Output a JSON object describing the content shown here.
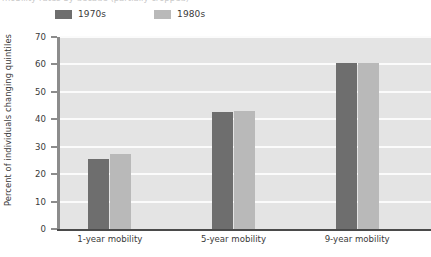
{
  "caption": {
    "cut_off_text": "mobility rates by decade (partially cropped)"
  },
  "legend": {
    "position": "top-left",
    "items": [
      {
        "label": "1970s",
        "color": "#6e6e6e",
        "swatch_name": "legend-swatch-1970s"
      },
      {
        "label": "1980s",
        "color": "#b9b9b9",
        "swatch_name": "legend-swatch-1980s"
      }
    ]
  },
  "axes": {
    "ylabel": "Percent of individuals changing quintiles",
    "xlabel": "",
    "yticks": [
      0,
      10,
      20,
      30,
      40,
      50,
      60,
      70
    ],
    "ylim": [
      0,
      70
    ]
  },
  "colors": {
    "plot_background": "#e4e4e4",
    "gridline": "#fbfbfb",
    "axis": "#8c8c8c",
    "baseline": "#4a4a4a",
    "text": "#3a3a3a",
    "series_1970s": "#6e6e6e",
    "series_1980s": "#b9b9b9"
  },
  "chart_data": {
    "type": "bar",
    "title": "",
    "xlabel": "",
    "ylabel": "Percent of individuals changing quintiles",
    "ylim": [
      0,
      70
    ],
    "yticks": [
      0,
      10,
      20,
      30,
      40,
      50,
      60,
      70
    ],
    "grid": true,
    "legend_position": "top-left",
    "categories": [
      "1-year mobility",
      "5-year mobility",
      "9-year mobility"
    ],
    "series": [
      {
        "name": "1970s",
        "color": "#6e6e6e",
        "values": [
          25.5,
          42.5,
          60.5
        ]
      },
      {
        "name": "1980s",
        "color": "#b9b9b9",
        "values": [
          27.5,
          43.0,
          60.5
        ]
      }
    ]
  }
}
